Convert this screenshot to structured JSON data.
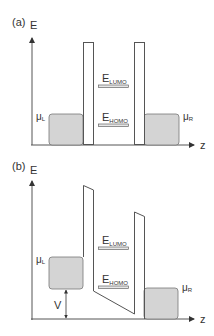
{
  "diagram": {
    "type": "energy-level diagram",
    "panels": [
      {
        "id": "a",
        "label": "(a)",
        "y_axis_label": "E",
        "x_axis_label": "z",
        "levels": {
          "lumo": {
            "base": "E",
            "sub": "LUMO"
          },
          "homo": {
            "base": "E",
            "sub": "HOMO"
          }
        },
        "chemical_potentials": {
          "left": {
            "base": "μ",
            "sub": "L"
          },
          "right": {
            "base": "μ",
            "sub": "R"
          }
        },
        "barriers": "rectangular, symmetric"
      },
      {
        "id": "b",
        "label": "(b)",
        "y_axis_label": "E",
        "x_axis_label": "z",
        "levels": {
          "lumo": {
            "base": "E",
            "sub": "LUMO"
          },
          "homo": {
            "base": "E",
            "sub": "HOMO"
          }
        },
        "chemical_potentials": {
          "left": {
            "base": "μ",
            "sub": "L"
          },
          "right": {
            "base": "μ",
            "sub": "R"
          }
        },
        "bias_label": "V",
        "barriers": "tilted under bias"
      }
    ],
    "colors": {
      "line": "#555555",
      "reservoir_fill": "#d4d4d4",
      "level_fill": "#e6e6e6",
      "text": "#333333"
    }
  }
}
